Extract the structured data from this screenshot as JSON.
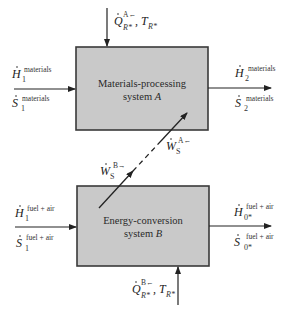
{
  "colors": {
    "box_fill": "#c9c9c9",
    "box_stroke": "#3a3a3a",
    "line": "#222222",
    "background": "#ffffff"
  },
  "system_a": {
    "line1": "Materials-processing",
    "line2_prefix": "system ",
    "line2_var": "A"
  },
  "system_b": {
    "line1": "Energy-conversion",
    "line2_prefix": "system ",
    "line2_var": "B"
  },
  "labels": {
    "heat_a": {
      "symbol": "Q",
      "superscript": "A←",
      "subscript": "R*",
      "separator": ",",
      "temp_symbol": "T",
      "temp_subscript": "R*"
    },
    "heat_b": {
      "symbol": "Q",
      "superscript": "B←",
      "subscript": "R*",
      "separator": ",",
      "temp_symbol": "T",
      "temp_subscript": "R*"
    },
    "h1_materials": {
      "symbol": "H",
      "subscript": "1",
      "superscript": "materials"
    },
    "s1_materials": {
      "symbol": "S",
      "subscript": "1",
      "superscript": "materials"
    },
    "h2_materials": {
      "symbol": "H",
      "subscript": "2",
      "superscript": "materials"
    },
    "s2_materials": {
      "symbol": "S",
      "subscript": "2",
      "superscript": "materials"
    },
    "h1_fuel": {
      "symbol": "H",
      "subscript": "1",
      "superscript": "fuel + air"
    },
    "s1_fuel": {
      "symbol": "S",
      "subscript": "1",
      "superscript": "fuel + air"
    },
    "h0_fuel": {
      "symbol": "H",
      "subscript": "0*",
      "superscript": "fuel + air"
    },
    "s0_fuel": {
      "symbol": "S",
      "subscript": "0*",
      "superscript": "fuel + air"
    },
    "work_b": {
      "symbol": "W",
      "subscript": "S",
      "superscript": "B→"
    },
    "work_a": {
      "symbol": "W",
      "subscript": "S",
      "superscript": "A←"
    }
  }
}
